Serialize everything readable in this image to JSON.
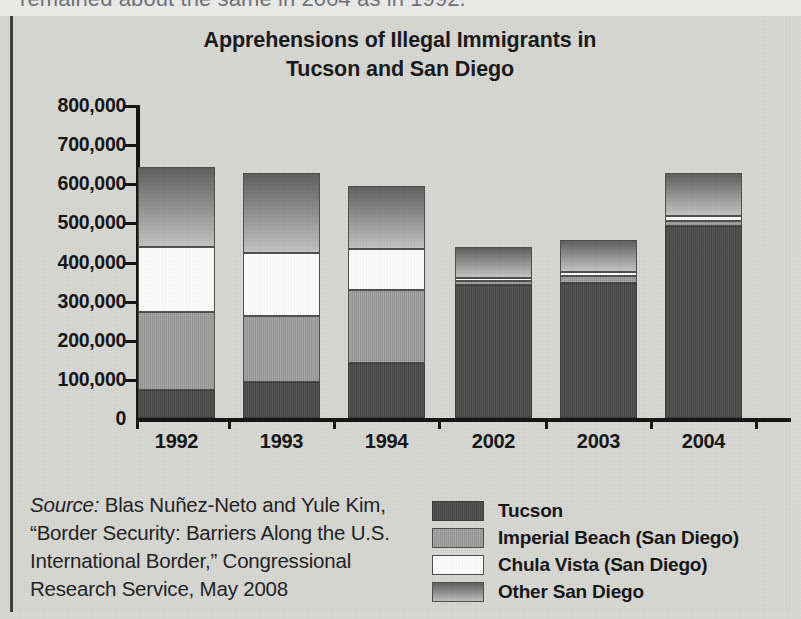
{
  "page": {
    "clipped_text_above": "remained about the same in 2004 as in 1992.",
    "background_color": "#d9d9d6"
  },
  "chart_data": {
    "type": "bar",
    "subtype": "stacked-bar",
    "title": "Apprehensions of Illegal Immigrants in Tucson and San Diego",
    "title_line1": "Apprehensions of Illegal Immigrants in",
    "title_line2": "Tucson and San Diego",
    "xlabel": "",
    "ylabel": "",
    "ylim": [
      0,
      800000
    ],
    "ytick_step": 100000,
    "grid": false,
    "legend_position": "bottom-right",
    "categories": [
      "1992",
      "1993",
      "1994",
      "2002",
      "2003",
      "2004"
    ],
    "ytick_labels": [
      "800,000",
      "700,000",
      "600,000",
      "500,000",
      "400,000",
      "300,000",
      "200,000",
      "100,000",
      "0"
    ],
    "ytick_values": [
      800000,
      700000,
      600000,
      500000,
      400000,
      300000,
      200000,
      100000,
      0
    ],
    "series": [
      {
        "name": "Tucson",
        "color": "#4a4a4a",
        "values": [
          72000,
          92000,
          141000,
          340000,
          345000,
          491000
        ]
      },
      {
        "name": "Imperial Beach (San Diego)",
        "color": "#9d9d9d",
        "values": [
          200000,
          169000,
          187000,
          10000,
          18000,
          13000
        ]
      },
      {
        "name": "Chula Vista (San Diego)",
        "color": "#fdfdfd",
        "values": [
          164000,
          161000,
          105000,
          8000,
          10000,
          13000
        ]
      },
      {
        "name": "Other San Diego",
        "color": "#8b8b8b",
        "values": [
          205000,
          205000,
          161000,
          79000,
          82000,
          110000
        ]
      }
    ],
    "totals": [
      641000,
      627000,
      594000,
      437000,
      455000,
      627000
    ]
  },
  "legend": {
    "entries": [
      {
        "label": "Tucson",
        "swatch": "sw-tucson"
      },
      {
        "label": "Imperial Beach (San Diego)",
        "swatch": "sw-imperial"
      },
      {
        "label": "Chula Vista (San Diego)",
        "swatch": "sw-chula"
      },
      {
        "label": "Other San Diego",
        "swatch": "sw-other"
      }
    ]
  },
  "source": {
    "label": "Source:",
    "text": " Blas Nuñez-Neto and Yule Kim, “Border Security: Barriers Along the U.S. International Border,” Congressional Research Service, May 2008"
  }
}
